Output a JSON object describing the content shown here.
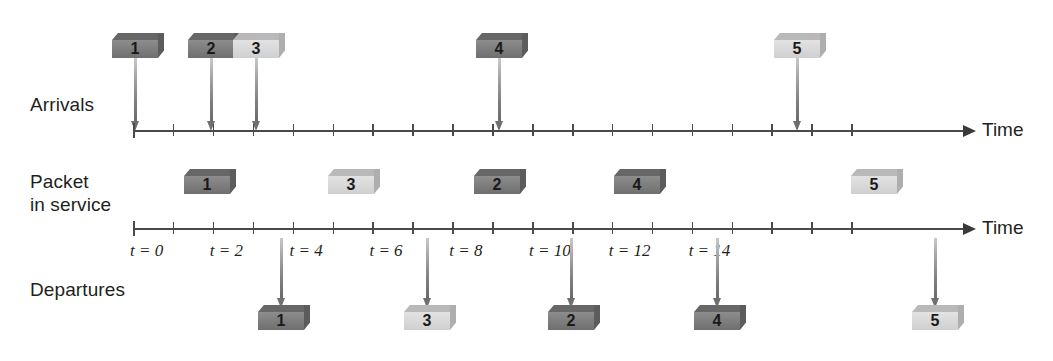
{
  "figure": {
    "time_axis_label": "Time",
    "colors": {
      "dark_packet": "#7c7c7c",
      "light_packet": "#d8d8d8",
      "axis": "#4a4a4a",
      "text": "#231f20"
    }
  },
  "rows": {
    "arrivals": {
      "label": "Arrivals",
      "time_label": "Time"
    },
    "in_service": {
      "label": "Packet\nin service",
      "time_label": "Time"
    },
    "departures": {
      "label": "Departures"
    }
  },
  "time_captions": [
    {
      "text": "t = 0",
      "t": 0
    },
    {
      "text": "t = 2",
      "t": 2
    },
    {
      "text": "t = 4",
      "t": 4
    },
    {
      "text": "t = 6",
      "t": 6
    },
    {
      "text": "t = 8",
      "t": 8
    },
    {
      "text": "t = 10",
      "t": 10
    },
    {
      "text": "t = 12",
      "t": 12
    },
    {
      "text": "t = 14",
      "t": 14
    }
  ],
  "chart_data": {
    "type": "timeline",
    "xlabel": "Time",
    "xlim": [
      0,
      18
    ],
    "tick_step": 1,
    "labeled_ticks": [
      0,
      2,
      4,
      6,
      8,
      10,
      12,
      14
    ],
    "packets": [
      {
        "id": "1",
        "shade": "dark",
        "arrival_t": 0,
        "service_start_t": 1,
        "departure_t": 3
      },
      {
        "id": "2",
        "shade": "dark",
        "arrival_t": 2,
        "service_start_t": 7,
        "departure_t": 9
      },
      {
        "id": "3",
        "shade": "light",
        "arrival_t": 3,
        "service_start_t": 4,
        "departure_t": 6
      },
      {
        "id": "4",
        "shade": "dark",
        "arrival_t": 8,
        "service_start_t": 10,
        "departure_t": 12
      },
      {
        "id": "5",
        "shade": "light",
        "arrival_t": 15,
        "service_start_t": 16,
        "departure_t": 17
      }
    ],
    "series": [
      {
        "name": "Arrivals",
        "packets": [
          "1",
          "2",
          "3",
          "4",
          "5"
        ],
        "t": [
          0,
          2,
          3,
          8,
          15
        ]
      },
      {
        "name": "Packet in service",
        "packets": [
          "1",
          "3",
          "2",
          "4",
          "5"
        ],
        "t": [
          1,
          4,
          7,
          10,
          16
        ]
      },
      {
        "name": "Departures",
        "packets": [
          "1",
          "3",
          "2",
          "4",
          "5"
        ],
        "t": [
          3,
          6,
          9,
          12,
          17
        ]
      }
    ]
  },
  "arrivals_boxes": [
    {
      "id": "1",
      "shade": "dark",
      "x": 112,
      "y": 33,
      "arrow_top": 58,
      "arrow_bottom": 131
    },
    {
      "id": "2",
      "shade": "dark",
      "x": 188,
      "y": 33,
      "arrow_top": 58,
      "arrow_bottom": 131
    },
    {
      "id": "3",
      "shade": "light",
      "x": 233,
      "y": 33,
      "arrow_top": 58,
      "arrow_bottom": 131
    },
    {
      "id": "4",
      "shade": "dark",
      "x": 476,
      "y": 33,
      "arrow_top": 58,
      "arrow_bottom": 131
    },
    {
      "id": "5",
      "shade": "light",
      "x": 774,
      "y": 33,
      "arrow_top": 58,
      "arrow_bottom": 131
    }
  ],
  "service_boxes": [
    {
      "id": "1",
      "shade": "dark",
      "x": 184,
      "y": 169
    },
    {
      "id": "3",
      "shade": "light",
      "x": 328,
      "y": 169
    },
    {
      "id": "2",
      "shade": "dark",
      "x": 474,
      "y": 169
    },
    {
      "id": "4",
      "shade": "dark",
      "x": 614,
      "y": 169
    },
    {
      "id": "5",
      "shade": "light",
      "x": 851,
      "y": 169
    }
  ],
  "departure_boxes": [
    {
      "id": "1",
      "shade": "dark",
      "x": 258,
      "y": 305,
      "arrow_top": 238,
      "arrow_bottom": 308
    },
    {
      "id": "3",
      "shade": "light",
      "x": 404,
      "y": 305,
      "arrow_top": 238,
      "arrow_bottom": 308
    },
    {
      "id": "2",
      "shade": "dark",
      "x": 548,
      "y": 305,
      "arrow_top": 238,
      "arrow_bottom": 308
    },
    {
      "id": "4",
      "shade": "dark",
      "x": 694,
      "y": 305,
      "arrow_top": 238,
      "arrow_bottom": 308
    },
    {
      "id": "5",
      "shade": "light",
      "x": 912,
      "y": 305,
      "arrow_top": 238,
      "arrow_bottom": 308
    }
  ],
  "axes": {
    "arrivals": {
      "x": 133,
      "y": 130,
      "width": 830,
      "tick_count": 19
    },
    "service": {
      "x": 133,
      "y": 228,
      "width": 830,
      "tick_count": 19
    }
  }
}
